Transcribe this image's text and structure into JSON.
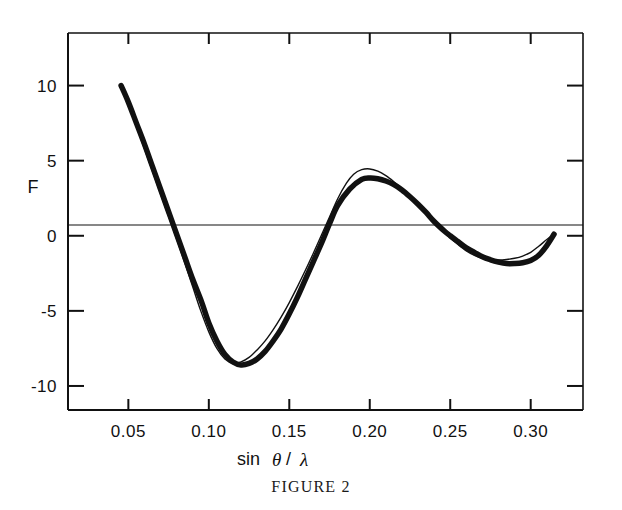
{
  "figure": {
    "caption": "FIGURE 2",
    "ylabel": "F",
    "xlabel_parts": {
      "sin": "sin",
      "theta": "θ",
      "slash": "/",
      "lambda": "λ"
    },
    "xlabel_full": "sin θ/ λ"
  },
  "chart_data": {
    "type": "line",
    "title": "",
    "subtitle": "",
    "xlabel": "sin θ/ λ",
    "ylabel": "F",
    "xlim": [
      0.0125,
      0.3325
    ],
    "ylim": [
      -11.6,
      13.5
    ],
    "grid": false,
    "legend": null,
    "axis": {
      "x_ticks": [
        0.05,
        0.1,
        0.15,
        0.2,
        0.25,
        0.3
      ],
      "x_tick_labels": [
        "0.05",
        "0.10",
        "0.15",
        "0.20",
        "0.25",
        "0.30"
      ],
      "y_ticks": [
        10,
        5,
        0,
        -5,
        -10
      ],
      "y_tick_labels": [
        "10",
        "5",
        "0",
        "-5",
        "-10"
      ],
      "ticks_on_top": true,
      "ticks_on_right": true,
      "right_tick_values": [
        10,
        5,
        0,
        -5,
        -10
      ],
      "frame": "box",
      "zero_line": true
    },
    "series": [
      {
        "name": "observed",
        "style": "thick",
        "linewidth": 5.5,
        "color": "#111111",
        "x": [
          0.0455,
          0.05,
          0.055,
          0.06,
          0.065,
          0.07,
          0.075,
          0.08,
          0.085,
          0.09,
          0.0955,
          0.1,
          0.105,
          0.11,
          0.115,
          0.12,
          0.125,
          0.13,
          0.135,
          0.14,
          0.145,
          0.15,
          0.155,
          0.16,
          0.165,
          0.17,
          0.175,
          0.18,
          0.1875,
          0.195,
          0.2,
          0.205,
          0.21,
          0.215,
          0.22,
          0.225,
          0.23,
          0.235,
          0.24,
          0.2465,
          0.25,
          0.255,
          0.26,
          0.265,
          0.27,
          0.275,
          0.28,
          0.285,
          0.29,
          0.295,
          0.3,
          0.305,
          0.31,
          0.3145
        ],
        "y": [
          10.0,
          8.9,
          7.5,
          6.1,
          4.6,
          3.1,
          1.6,
          0.1,
          -1.4,
          -2.9,
          -4.4,
          -5.8,
          -7.0,
          -7.9,
          -8.4,
          -8.6,
          -8.5,
          -8.2,
          -7.7,
          -7.0,
          -6.2,
          -5.2,
          -4.1,
          -2.9,
          -1.7,
          -0.5,
          0.8,
          2.0,
          3.1,
          3.75,
          3.85,
          3.8,
          3.65,
          3.4,
          3.05,
          2.6,
          2.1,
          1.55,
          0.95,
          0.3,
          0.0,
          -0.4,
          -0.8,
          -1.1,
          -1.4,
          -1.6,
          -1.75,
          -1.85,
          -1.85,
          -1.8,
          -1.65,
          -1.3,
          -0.65,
          0.1
        ]
      },
      {
        "name": "calculated",
        "style": "thin",
        "linewidth": 1.4,
        "color": "#111111",
        "x": [
          0.0455,
          0.05,
          0.055,
          0.06,
          0.065,
          0.07,
          0.075,
          0.08,
          0.085,
          0.09,
          0.095,
          0.1,
          0.105,
          0.11,
          0.115,
          0.12,
          0.125,
          0.13,
          0.135,
          0.14,
          0.145,
          0.15,
          0.155,
          0.16,
          0.165,
          0.17,
          0.175,
          0.18,
          0.1855,
          0.19,
          0.195,
          0.2,
          0.205,
          0.21,
          0.215,
          0.22,
          0.225,
          0.23,
          0.235,
          0.24,
          0.245,
          0.25,
          0.255,
          0.26,
          0.265,
          0.27,
          0.275,
          0.28,
          0.285,
          0.29,
          0.295,
          0.3,
          0.305,
          0.31,
          0.3145
        ],
        "y": [
          10.0,
          8.8,
          7.3,
          5.8,
          4.3,
          2.8,
          1.3,
          -0.2,
          -1.8,
          -3.4,
          -5.0,
          -6.4,
          -7.5,
          -8.2,
          -8.5,
          -8.4,
          -8.1,
          -7.6,
          -7.0,
          -6.25,
          -5.4,
          -4.45,
          -3.4,
          -2.3,
          -1.15,
          0.05,
          1.25,
          2.45,
          3.5,
          4.1,
          4.4,
          4.45,
          4.3,
          4.0,
          3.6,
          3.15,
          2.65,
          2.1,
          1.5,
          0.9,
          0.35,
          -0.15,
          -0.6,
          -1.0,
          -1.3,
          -1.5,
          -1.6,
          -1.62,
          -1.58,
          -1.5,
          -1.35,
          -1.1,
          -0.7,
          -0.25,
          0.1
        ]
      }
    ],
    "annotations": []
  }
}
